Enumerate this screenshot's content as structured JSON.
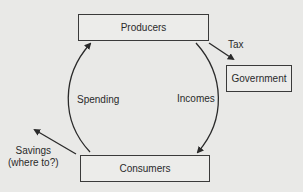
{
  "diagram": {
    "type": "circular-flow",
    "nodes": {
      "producers": "Producers",
      "consumers": "Consumers",
      "government": "Government"
    },
    "flows": {
      "spending": "Spending",
      "incomes": "Incomes",
      "tax": "Tax",
      "savings_line1": "Savings",
      "savings_line2": "(where to?)"
    },
    "edges": [
      {
        "from": "Consumers",
        "to": "Producers",
        "label": "Spending"
      },
      {
        "from": "Producers",
        "to": "Consumers",
        "label": "Incomes"
      },
      {
        "from": "Producers",
        "to": "Government",
        "label": "Tax"
      },
      {
        "from": "Consumers",
        "to": "outside",
        "label": "Savings (where to?)"
      }
    ],
    "colors": {
      "background": "#e9e9e7",
      "stroke": "#3a3a3a"
    }
  }
}
